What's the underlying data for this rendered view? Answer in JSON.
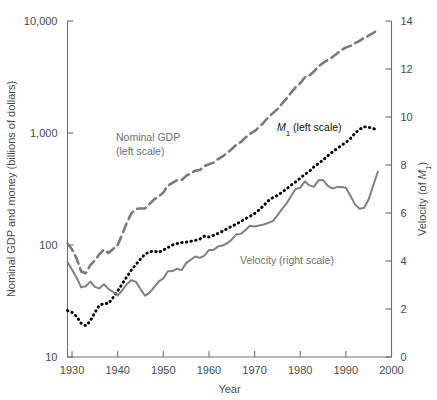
{
  "chart_data": {
    "type": "line",
    "title": "",
    "xlabel": "Year",
    "ylabel": "Nominal GDP and money (billions of dollars)",
    "y2label": "Velocity (of M1)",
    "y2label_parts": {
      "pre": "Velocity (of ",
      "italic": "M",
      "sub": "1",
      "post": ")"
    },
    "xlim": [
      1929,
      2000
    ],
    "ylim": [
      10,
      10000
    ],
    "y_scale": "log",
    "y2lim": [
      0,
      14
    ],
    "grid": false,
    "legend": "inline-annotations",
    "xticks": [
      1930,
      1940,
      1950,
      1960,
      1970,
      1980,
      1990,
      2000
    ],
    "xticklabels": [
      "1930",
      "1940",
      "1950",
      "1960",
      "1970",
      "1980",
      "1990",
      "2000"
    ],
    "yticks": [
      10,
      100,
      1000,
      10000
    ],
    "yticklabels": [
      "10",
      "100",
      "1,000",
      "10,000"
    ],
    "y2ticks": [
      0,
      2,
      4,
      6,
      8,
      10,
      12,
      14
    ],
    "y2ticklabels": [
      "0",
      "2",
      "4",
      "6",
      "8",
      "10",
      "12",
      "14"
    ],
    "annotations": [
      {
        "name": "nominal-gdp-label",
        "line1": "Nominal GDP",
        "line2": "(left scale)",
        "x": 116,
        "y": 141,
        "color": "#6e6e6e"
      },
      {
        "name": "m1-label",
        "pre": "",
        "italic": "M",
        "sub": "1",
        "post": " (left scale)",
        "x": 277,
        "y": 131,
        "color": "#111111"
      },
      {
        "name": "velocity-label",
        "text": "Velocity (right scale)",
        "x": 240,
        "y": 264,
        "color": "#6e6e6e"
      }
    ],
    "series": [
      {
        "name": "Nominal GDP (left scale)",
        "axis": "left",
        "style": "dashed",
        "color": "#7a7a7a",
        "x": [
          1929,
          1930,
          1931,
          1932,
          1933,
          1934,
          1935,
          1936,
          1937,
          1938,
          1939,
          1940,
          1941,
          1942,
          1943,
          1944,
          1945,
          1946,
          1947,
          1948,
          1949,
          1950,
          1951,
          1952,
          1953,
          1954,
          1955,
          1956,
          1957,
          1958,
          1959,
          1960,
          1961,
          1962,
          1963,
          1964,
          1965,
          1966,
          1967,
          1968,
          1969,
          1970,
          1971,
          1972,
          1973,
          1974,
          1975,
          1976,
          1977,
          1978,
          1979,
          1980,
          1981,
          1982,
          1983,
          1984,
          1985,
          1986,
          1987,
          1988,
          1989,
          1990,
          1991,
          1992,
          1993,
          1994,
          1995,
          1996,
          1997
        ],
        "values": [
          103,
          91,
          76,
          58,
          56,
          66,
          73,
          83,
          91,
          85,
          92,
          100,
          125,
          158,
          192,
          210,
          212,
          212,
          233,
          256,
          271,
          294,
          339,
          358,
          379,
          380,
          414,
          437,
          461,
          467,
          506,
          526,
          544,
          585,
          618,
          664,
          719,
          787,
          832,
          910,
          984,
          1039,
          1128,
          1241,
          1386,
          1501,
          1635,
          1824,
          2030,
          2294,
          2563,
          2789,
          3128,
          3255,
          3536,
          3933,
          4220,
          4462,
          4739,
          5103,
          5484,
          5803,
          5995,
          6337,
          6657,
          7072,
          7397,
          7816,
          8300
        ]
      },
      {
        "name": "M1 (left scale)",
        "axis": "left",
        "style": "dotted",
        "color": "#000000",
        "x": [
          1929,
          1930,
          1931,
          1932,
          1933,
          1934,
          1935,
          1936,
          1937,
          1938,
          1939,
          1940,
          1941,
          1942,
          1943,
          1944,
          1945,
          1946,
          1947,
          1948,
          1949,
          1950,
          1951,
          1952,
          1953,
          1954,
          1955,
          1956,
          1957,
          1958,
          1959,
          1960,
          1961,
          1962,
          1963,
          1964,
          1965,
          1966,
          1967,
          1968,
          1969,
          1970,
          1971,
          1972,
          1973,
          1974,
          1975,
          1976,
          1977,
          1978,
          1979,
          1980,
          1981,
          1982,
          1983,
          1984,
          1985,
          1986,
          1987,
          1988,
          1989,
          1990,
          1991,
          1992,
          1993,
          1994,
          1995,
          1996,
          1997
        ],
        "values": [
          26,
          25,
          23,
          20,
          19,
          21,
          25,
          29,
          30,
          30,
          34,
          39,
          45,
          52,
          60,
          67,
          75,
          83,
          87,
          88,
          86,
          90,
          95,
          100,
          103,
          105,
          106,
          108,
          110,
          113,
          120,
          118,
          122,
          127,
          133,
          140,
          147,
          154,
          162,
          172,
          180,
          191,
          206,
          225,
          248,
          265,
          277,
          296,
          317,
          342,
          366,
          395,
          427,
          455,
          499,
          534,
          573,
          625,
          675,
          721,
          775,
          823,
          892,
          997,
          1077,
          1136,
          1126,
          1093,
          1075
        ]
      },
      {
        "name": "Velocity (right scale)",
        "axis": "right",
        "style": "solid",
        "color": "#808080",
        "x": [
          1929,
          1930,
          1931,
          1932,
          1933,
          1934,
          1935,
          1936,
          1937,
          1938,
          1939,
          1940,
          1941,
          1942,
          1943,
          1944,
          1945,
          1946,
          1947,
          1948,
          1949,
          1950,
          1951,
          1952,
          1953,
          1954,
          1955,
          1956,
          1957,
          1958,
          1959,
          1960,
          1961,
          1962,
          1963,
          1964,
          1965,
          1966,
          1967,
          1968,
          1969,
          1970,
          1971,
          1972,
          1973,
          1974,
          1975,
          1976,
          1977,
          1978,
          1979,
          1980,
          1981,
          1982,
          1983,
          1984,
          1985,
          1986,
          1987,
          1988,
          1989,
          1990,
          1991,
          1992,
          1993,
          1994,
          1995,
          1996,
          1997
        ],
        "values": [
          3.96,
          3.64,
          3.3,
          2.9,
          2.95,
          3.14,
          2.92,
          2.86,
          3.03,
          2.83,
          2.71,
          2.56,
          2.78,
          3.04,
          3.2,
          3.13,
          2.83,
          2.55,
          2.68,
          2.91,
          3.15,
          3.27,
          3.57,
          3.58,
          3.68,
          3.62,
          3.91,
          4.05,
          4.19,
          4.13,
          4.22,
          4.46,
          4.46,
          4.61,
          4.65,
          4.74,
          4.89,
          5.11,
          5.13,
          5.29,
          5.47,
          5.44,
          5.48,
          5.52,
          5.59,
          5.66,
          5.9,
          6.16,
          6.4,
          6.71,
          7.0,
          7.06,
          7.32,
          7.15,
          7.09,
          7.36,
          7.37,
          7.14,
          7.02,
          7.08,
          7.08,
          7.05,
          6.72,
          6.36,
          6.18,
          6.22,
          6.57,
          7.15,
          7.72
        ]
      }
    ]
  },
  "axes": {
    "left_axis_name": "left-value-axis",
    "right_axis_name": "right-velocity-axis",
    "bottom_axis_name": "year-axis"
  }
}
